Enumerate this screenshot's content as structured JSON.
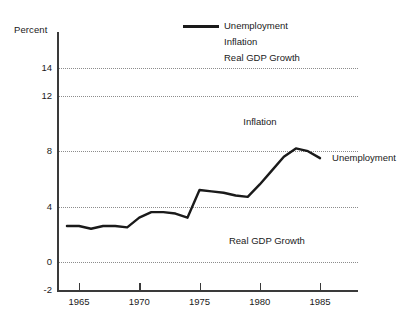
{
  "chart_data": {
    "type": "line",
    "title": "",
    "xlabel": "",
    "ylabel": "Percent",
    "xlim": [
      1963.5,
      1986.5
    ],
    "ylim": [
      -2,
      15.2
    ],
    "grid": true,
    "grid_orientation": "horizontal",
    "grid_style": "dotted",
    "legend_position": "top-right",
    "x_ticks": [
      1965,
      1970,
      1975,
      1980,
      1985
    ],
    "x_tick_labels": [
      "1965",
      "1970",
      "1975",
      "1980",
      "1985"
    ],
    "y_ticks": [
      -2,
      0,
      4,
      8,
      12,
      14
    ],
    "y_tick_labels": [
      "-2",
      "0",
      "4",
      "8",
      "12",
      "14"
    ],
    "series": [
      {
        "name": "Unemployment",
        "visible": true,
        "color": "#1a1a1a",
        "x": [
          1964,
          1965,
          1966,
          1967,
          1968,
          1969,
          1970,
          1971,
          1972,
          1973,
          1974,
          1975,
          1976,
          1977,
          1978,
          1979,
          1980,
          1981,
          1982,
          1983,
          1984,
          1985
        ],
        "values": [
          2.6,
          2.6,
          2.4,
          2.6,
          2.6,
          2.5,
          3.2,
          3.6,
          3.6,
          3.5,
          3.2,
          5.2,
          5.1,
          5.0,
          4.8,
          4.7,
          5.6,
          6.6,
          7.6,
          8.2,
          8.0,
          7.5
        ]
      },
      {
        "name": "Inflation",
        "visible": false,
        "color": "#1a1a1a",
        "x": [],
        "values": []
      },
      {
        "name": "Real GDP Growth",
        "visible": false,
        "color": "#1a1a1a",
        "x": [],
        "values": []
      }
    ],
    "annotations": [
      {
        "text": "Inflation",
        "x": 1980.0,
        "y": 10.1
      },
      {
        "text": "Unemployment",
        "x": 1986.0,
        "y": 7.5
      },
      {
        "text": "Real GDP Growth",
        "x": 1980.6,
        "y": 1.5
      }
    ]
  },
  "legend": {
    "items": [
      {
        "label": "Unemployment",
        "has_swatch": true
      },
      {
        "label": "Inflation",
        "has_swatch": false
      },
      {
        "label": "Real GDP Growth",
        "has_swatch": false
      }
    ]
  },
  "axis": {
    "y_title": "Percent"
  }
}
